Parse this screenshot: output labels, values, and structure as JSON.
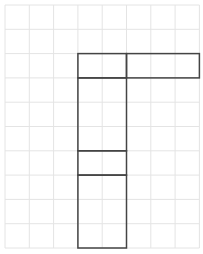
{
  "diagram": {
    "type": "grid-shape",
    "grid": {
      "columns": 8,
      "rows": 10,
      "cell_size": 24.3,
      "origin_x": 5,
      "origin_y": 5,
      "line_color": "#e4e4e4"
    },
    "shape": {
      "stroke_color": "#444444",
      "description": "Polyomino-like outline: a horizontal bar across columns 3-8 in row 3 joined with a vertical bar across columns 3-4 spanning rows 3-10, with internal dividers",
      "rects": [
        {
          "name": "top-left-cell",
          "col": 3,
          "row": 2,
          "cols": 2,
          "rows": 1
        },
        {
          "name": "top-right-bar",
          "col": 5,
          "row": 2,
          "cols": 3,
          "rows": 1
        },
        {
          "name": "stem-upper",
          "col": 3,
          "row": 3,
          "cols": 2,
          "rows": 3
        },
        {
          "name": "stem-middle",
          "col": 3,
          "row": 6,
          "cols": 2,
          "rows": 1
        },
        {
          "name": "stem-lower",
          "col": 3,
          "row": 7,
          "cols": 2,
          "rows": 3
        }
      ]
    }
  }
}
